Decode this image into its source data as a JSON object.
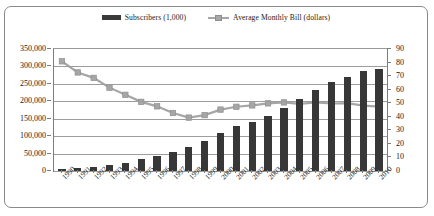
{
  "legend": {
    "items": [
      {
        "label": "Subscribers (1,000)",
        "icon": "bar-swatch-icon",
        "color": "#373737"
      },
      {
        "label": "Average Monthly Bill (dollars)",
        "icon": "line-marker-swatch-icon",
        "color": "#a6a6a6"
      }
    ]
  },
  "axes": {
    "left": {
      "ticks": [
        "350,000",
        "300,000",
        "250,000",
        "200,000",
        "150,000",
        "100,000",
        "50,000",
        "0"
      ]
    },
    "right": {
      "ticks": [
        "90",
        "80",
        "70",
        "60",
        "50",
        "40",
        "30",
        "20",
        "10",
        "0"
      ]
    }
  },
  "chart_data": {
    "type": "bar",
    "title": "",
    "subtitle": "",
    "xlabel": "",
    "ylabel": "",
    "grid": true,
    "legend_position": "top-center",
    "categories": [
      "1990",
      "1991",
      "1992",
      "1993",
      "1994",
      "1995",
      "1996",
      "1997",
      "1998",
      "1999",
      "2000",
      "2001",
      "2002",
      "2003",
      "2004",
      "2005",
      "2006",
      "2007",
      "2008",
      "2009",
      "2010"
    ],
    "series": [
      {
        "name": "Subscribers (1,000)",
        "type": "bar",
        "axis": "left",
        "color": "#373737",
        "values": [
          5283,
          7557,
          11033,
          16009,
          24134,
          33786,
          44043,
          55312,
          69209,
          86047,
          109478,
          128375,
          140767,
          158722,
          182140,
          207896,
          233041,
          255396,
          270334,
          285646,
          292847
        ],
        "ylim": [
          0,
          350000
        ],
        "ytick_step": 50000
      },
      {
        "name": "Average Monthly Bill (dollars)",
        "type": "line",
        "axis": "right",
        "color": "#a6a6a6",
        "values": [
          80.9,
          72.7,
          68.7,
          61.5,
          56.2,
          51.0,
          47.7,
          42.8,
          39.4,
          41.2,
          45.3,
          47.4,
          48.4,
          49.9,
          50.6,
          49.5,
          50.6,
          49.8,
          50.1,
          48.2,
          47.5
        ],
        "ylim": [
          0,
          90
        ],
        "ytick_step": 10
      }
    ]
  }
}
